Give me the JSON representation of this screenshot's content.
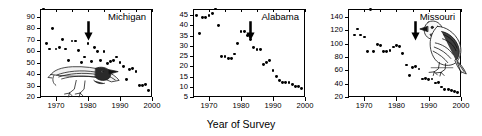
{
  "figure": {
    "ylabel": "House Sparrows per Route",
    "xlabel": "Year of Survey"
  },
  "chart_data": [
    {
      "type": "scatter",
      "title": "Michigan",
      "xlabel": "Year of Survey",
      "ylabel": "House Sparrows per Route",
      "xlim": [
        1965,
        2000
      ],
      "ylim": [
        20,
        97
      ],
      "xticks": [
        1970,
        1980,
        1990,
        2000
      ],
      "yticks": [
        20,
        30,
        40,
        50,
        60,
        70,
        80,
        90
      ],
      "grid": false,
      "legend": "none",
      "annotation_arrow_year": 1980,
      "x": [
        1966,
        1967,
        1968,
        1969,
        1970,
        1971,
        1972,
        1973,
        1974,
        1975,
        1976,
        1977,
        1978,
        1979,
        1980,
        1981,
        1982,
        1983,
        1984,
        1985,
        1986,
        1987,
        1988,
        1989,
        1990,
        1991,
        1992,
        1993,
        1994,
        1995,
        1996,
        1997,
        1998,
        1999
      ],
      "y": [
        97,
        67,
        62,
        80,
        62,
        63,
        70,
        62,
        52,
        69,
        69,
        61,
        50,
        55,
        67,
        51,
        63,
        60,
        52,
        60,
        49,
        51,
        52,
        55,
        50,
        47,
        35,
        44,
        45,
        42,
        30,
        30,
        31,
        26
      ]
    },
    {
      "type": "scatter",
      "title": "Alabama",
      "xlabel": "Year of Survey",
      "ylabel": "House Sparrows per Route",
      "xlim": [
        1965,
        2000
      ],
      "ylim": [
        5,
        48
      ],
      "xticks": [
        1970,
        1980,
        1990,
        2000
      ],
      "yticks": [
        5,
        10,
        15,
        20,
        25,
        30,
        35,
        40,
        45
      ],
      "grid": false,
      "legend": "none",
      "annotation_arrow_year": 1983,
      "x": [
        1966,
        1967,
        1968,
        1969,
        1970,
        1971,
        1972,
        1973,
        1974,
        1975,
        1976,
        1977,
        1978,
        1979,
        1980,
        1981,
        1982,
        1983,
        1984,
        1985,
        1986,
        1987,
        1988,
        1989,
        1990,
        1991,
        1992,
        1993,
        1994,
        1995,
        1996,
        1997,
        1998,
        1999
      ],
      "y": [
        45,
        36,
        44,
        44,
        45,
        46,
        48,
        40,
        25,
        25,
        24,
        24,
        26,
        31,
        37,
        37,
        35,
        33,
        29,
        28,
        28,
        21,
        22,
        23,
        18,
        15,
        13,
        12,
        12,
        12,
        11,
        10,
        10,
        9
      ]
    },
    {
      "type": "scatter",
      "title": "Missouri",
      "xlabel": "Year of Survey",
      "ylabel": "House Sparrows per Route",
      "xlim": [
        1965,
        2000
      ],
      "ylim": [
        20,
        152
      ],
      "xticks": [
        1970,
        1980,
        1990,
        2000
      ],
      "yticks": [
        20,
        40,
        60,
        80,
        100,
        120,
        140
      ],
      "grid": false,
      "legend": "none",
      "annotation_arrow_year": 1986,
      "x": [
        1967,
        1968,
        1969,
        1970,
        1971,
        1972,
        1973,
        1974,
        1975,
        1976,
        1977,
        1978,
        1979,
        1980,
        1981,
        1982,
        1983,
        1984,
        1985,
        1986,
        1987,
        1988,
        1989,
        1990,
        1991,
        1992,
        1993,
        1994,
        1995,
        1996,
        1997,
        1998,
        1999
      ],
      "y": [
        113,
        122,
        113,
        110,
        88,
        151,
        88,
        99,
        97,
        88,
        88,
        90,
        95,
        97,
        96,
        85,
        68,
        52,
        64,
        66,
        62,
        47,
        48,
        46,
        47,
        41,
        42,
        35,
        31,
        31,
        30,
        28,
        27
      ]
    }
  ]
}
